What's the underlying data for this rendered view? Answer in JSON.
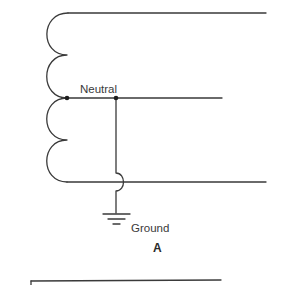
{
  "diagram": {
    "type": "transformer-winding-grounding-schematic",
    "labels": {
      "neutral": "Neutral",
      "ground": "Ground",
      "caption": "A"
    },
    "components": [
      {
        "name": "transformer-winding",
        "kind": "coil",
        "loops": 4
      },
      {
        "name": "top-line-conductor",
        "kind": "wire"
      },
      {
        "name": "neutral-conductor",
        "kind": "wire"
      },
      {
        "name": "bottom-line-conductor",
        "kind": "wire"
      },
      {
        "name": "grounding-conductor",
        "kind": "wire",
        "crosses": "bottom-line-conductor",
        "crossing_style": "hop"
      },
      {
        "name": "ground-symbol",
        "kind": "earth-ground"
      }
    ],
    "nodes": [
      {
        "name": "winding-center-tap",
        "connects": [
          "transformer-winding",
          "neutral-conductor"
        ]
      },
      {
        "name": "neutral-ground-junction",
        "connects": [
          "neutral-conductor",
          "grounding-conductor"
        ]
      }
    ],
    "colors": {
      "line": "#3a3a3a",
      "node": "#1e1e1e",
      "background": "#ffffff"
    }
  }
}
